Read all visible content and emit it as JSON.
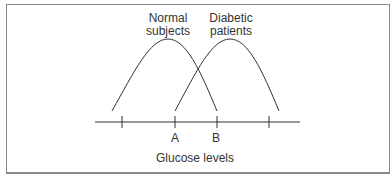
{
  "diagram": {
    "curves": [
      {
        "label_line1": "Normal",
        "label_line2": "subjects"
      },
      {
        "label_line1": "Diabetic",
        "label_line2": "patients"
      }
    ],
    "axis": {
      "title": "Glucose levels",
      "markers": [
        {
          "label": "A"
        },
        {
          "label": "B"
        }
      ]
    },
    "colors": {
      "line": "#333333",
      "frame": "#8a8a8a"
    }
  }
}
